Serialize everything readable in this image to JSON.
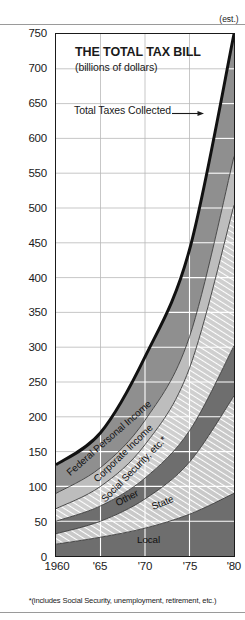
{
  "chart_data": {
    "type": "area",
    "title": "THE TOTAL TAX BILL",
    "subtitle": "(billions of dollars)",
    "xlabel": "",
    "ylabel": "",
    "ylim": [
      0,
      750
    ],
    "ytick_step": 50,
    "grid": true,
    "stacked": true,
    "legend_position": "inline-band-labels",
    "annotation": "Total Taxes Collected",
    "footnote": "*(includes Social Security, unemployment, retirement, etc.)",
    "x": [
      1960,
      1965,
      1970,
      1975,
      1980
    ],
    "xtick_labels": [
      "1960",
      "'65",
      "'70",
      "'75",
      "'80"
    ],
    "xtick_sublabel_last": "(est.)",
    "ytick_labels": [
      "750",
      "700",
      "650",
      "600",
      "550",
      "500",
      "450",
      "400",
      "350",
      "300",
      "250",
      "200",
      "150",
      "100",
      "50",
      "0"
    ],
    "series": [
      {
        "name": "Local",
        "order": 1,
        "color": "#6e6e6e",
        "pattern": "solid",
        "values": [
          17,
          27,
          40,
          60,
          90
        ]
      },
      {
        "name": "State",
        "order": 2,
        "color": "#c9c9c9",
        "pattern": "diagonal-hatch",
        "values": [
          15,
          23,
          42,
          75,
          140
        ]
      },
      {
        "name": "Other",
        "order": 3,
        "color": "#6e6e6e",
        "pattern": "solid",
        "values": [
          18,
          22,
          30,
          45,
          72
        ]
      },
      {
        "name": "Social Security, etc.*",
        "order": 4,
        "color": "#cfcfcf",
        "pattern": "diagonal-hatch",
        "values": [
          18,
          28,
          48,
          90,
          202
        ]
      },
      {
        "name": "Corporate Income",
        "order": 5,
        "color": "#bdbdbd",
        "pattern": "solid",
        "values": [
          22,
          27,
          35,
          45,
          70
        ]
      },
      {
        "name": "Federal Personal Income",
        "order": 6,
        "color": "#8f8f8f",
        "pattern": "solid",
        "values": [
          41,
          50,
          91,
          125,
          176
        ]
      }
    ],
    "totals": [
      131,
      177,
      286,
      440,
      750
    ],
    "colors": {
      "axis": "#1a1a1a",
      "gridline_over_fill": "#ffffff",
      "gridline_over_blank": "#b8b8b8",
      "band_outline": "#2a2a2a",
      "top_outline": "#111111",
      "background": "#ffffff",
      "rule": "#9a9a9a"
    }
  },
  "axes": {
    "y_ticks": [
      {
        "label": "750",
        "value": 750
      },
      {
        "label": "700",
        "value": 700
      },
      {
        "label": "650",
        "value": 650
      },
      {
        "label": "600",
        "value": 600
      },
      {
        "label": "550",
        "value": 550
      },
      {
        "label": "500",
        "value": 500
      },
      {
        "label": "450",
        "value": 450
      },
      {
        "label": "400",
        "value": 400
      },
      {
        "label": "350",
        "value": 350
      },
      {
        "label": "300",
        "value": 300
      },
      {
        "label": "250",
        "value": 250
      },
      {
        "label": "200",
        "value": 200
      },
      {
        "label": "150",
        "value": 150
      },
      {
        "label": "100",
        "value": 100
      },
      {
        "label": "50",
        "value": 50
      },
      {
        "label": "0",
        "value": 0
      }
    ],
    "x_ticks": [
      {
        "label": "1960",
        "value": 1960
      },
      {
        "label": "'65",
        "value": 1965
      },
      {
        "label": "'70",
        "value": 1970
      },
      {
        "label": "'75",
        "value": 1975
      },
      {
        "label": "'80",
        "value": 1980
      }
    ]
  },
  "title": {
    "main": "THE TOTAL TAX BILL",
    "sub": "(billions of dollars)"
  },
  "annotation": {
    "text": "Total Taxes Collected",
    "arrow": "right-arrow-icon"
  },
  "band_labels": {
    "federal_personal_income": "Federal Personal Income",
    "corporate_income": "Corporate Income",
    "social_security": "Social Security, etc.*",
    "other": "Other",
    "state": "State",
    "local": "Local"
  },
  "footnote": {
    "text": "*(includes Social Security, unemployment, retirement, etc.)"
  },
  "x_axis_est": {
    "text": "(est.)"
  }
}
